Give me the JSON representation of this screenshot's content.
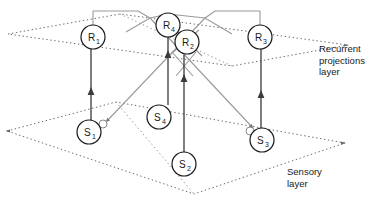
{
  "figure": {
    "type": "neural-network-schematic",
    "background_color": "#ffffff",
    "plane_color": "#5a5a5a",
    "recurrent_link_color": "#9a9a9a",
    "feedforward_link_color": "#3a3a3a",
    "node_stroke_color": "#1a1a1a",
    "text_color": "#1a1a1a"
  },
  "captions": {
    "recurrent": "Recurrent\nprojections\nlayer",
    "sensory": "Sensory\nlayer"
  },
  "planes": [
    {
      "name": "recurrent-plane",
      "style": "dotted",
      "points": "8,34 120,14 348,45 232,66"
    },
    {
      "name": "sensory-plane",
      "style": "dotted",
      "points": "7,131 116,102 345,143 194,194"
    }
  ],
  "nodes": {
    "recurrent": [
      {
        "id": "R1",
        "label": "R",
        "sub": "1",
        "cx": 93,
        "cy": 37,
        "r": 12
      },
      {
        "id": "R4",
        "label": "R",
        "sub": "4",
        "cx": 168,
        "cy": 25,
        "r": 12
      },
      {
        "id": "R2",
        "label": "R",
        "sub": "2",
        "cx": 187,
        "cy": 42,
        "r": 12
      },
      {
        "id": "R3",
        "label": "R",
        "sub": "3",
        "cx": 260,
        "cy": 37,
        "r": 12
      }
    ],
    "sensory": [
      {
        "id": "S1",
        "label": "S",
        "sub": "1",
        "cx": 89,
        "cy": 132,
        "r": 12
      },
      {
        "id": "S4",
        "label": "S",
        "sub": "4",
        "cx": 167,
        "cy": 117,
        "r": 12
      },
      {
        "id": "S2",
        "label": "S",
        "sub": "2",
        "cx": 184,
        "cy": 164,
        "r": 12
      },
      {
        "id": "S3",
        "label": "S",
        "sub": "3",
        "cx": 262,
        "cy": 140,
        "r": 12
      }
    ]
  },
  "feedforward_connections": [
    {
      "name": "S1-to-R1",
      "from": "S1",
      "to": "R1",
      "x": 91,
      "y1": 120,
      "y2": 49
    },
    {
      "name": "S4-to-R4",
      "from": "S4",
      "to": "R4",
      "x": 168,
      "y1": 105,
      "y2": 37
    },
    {
      "name": "S2-to-R2",
      "from": "S2",
      "to": "R2",
      "x": 184,
      "y1": 152,
      "y2": 55
    },
    {
      "name": "S3-to-R3",
      "from": "S3",
      "to": "R3",
      "x": 261,
      "y1": 128,
      "y2": 49
    }
  ],
  "recurrent_projections": [
    {
      "name": "R1-to-S3-synapse",
      "note": "gray projection from R1 over the top, descending to a synapse near S3"
    },
    {
      "name": "R3-to-S1-synapse",
      "note": "gray projection from R3 over the top, descending to a synapse near S1"
    },
    {
      "name": "R2-R4-crossing",
      "note": "gray crossing projections around R2 / R4"
    }
  ],
  "synapses": [
    {
      "name": "synapse-on-S1",
      "cx": 103,
      "cy": 124,
      "r": 4
    },
    {
      "name": "synapse-on-S3",
      "cx": 250,
      "cy": 131,
      "r": 4
    }
  ]
}
